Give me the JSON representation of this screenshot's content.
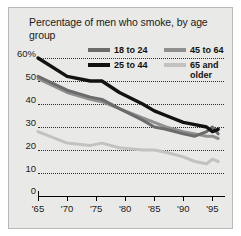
{
  "figure": {
    "title": "Percentage of men who smoke, by age group",
    "background": "#e9e9e7",
    "border": "#b9b9b7"
  },
  "legend": {
    "position": "top-right",
    "items": [
      {
        "label": "18 to 24",
        "color": "#6b6b6b"
      },
      {
        "label": "45 to 64",
        "color": "#8f8f8f"
      },
      {
        "label": "25 to 44",
        "color": "#121212"
      },
      {
        "label": "65 and\nolder",
        "color": "#c2c2c2"
      }
    ]
  },
  "axes": {
    "ylabels": [
      "60%",
      "50",
      "40",
      "30",
      "20",
      "10",
      "0"
    ],
    "xlabels": [
      "'65",
      "'70",
      "'75",
      "'80",
      "'85",
      "'90",
      "'95"
    ]
  },
  "chart_data": {
    "type": "line",
    "title": "Percentage of men who smoke, by age group",
    "xlabel": "",
    "ylabel": "",
    "xlim": [
      1965,
      1997
    ],
    "ylim": [
      0,
      60
    ],
    "yticks": [
      0,
      10,
      20,
      30,
      40,
      50,
      60
    ],
    "ytick_labels": [
      "0",
      "10",
      "20",
      "30",
      "40",
      "50",
      "60%"
    ],
    "xticks": [
      1965,
      1970,
      1975,
      1980,
      1985,
      1990,
      1995
    ],
    "xtick_labels": [
      "'65",
      "'70",
      "'75",
      "'80",
      "'85",
      "'90",
      "'95"
    ],
    "grid": "horizontal-dotted",
    "legend_position": "upper-right",
    "x": [
      1965,
      1970,
      1974,
      1976,
      1979,
      1983,
      1985,
      1987,
      1990,
      1992,
      1994,
      1995,
      1996
    ],
    "series": [
      {
        "name": "25 to 44",
        "color": "#121212",
        "values": [
          60,
          52,
          50,
          50,
          45,
          40,
          37,
          35,
          32,
          31,
          30,
          28,
          29
        ]
      },
      {
        "name": "18 to 24",
        "color": "#6b6b6b",
        "values": [
          52,
          46,
          43,
          42,
          38,
          33,
          30,
          29,
          27,
          26,
          28,
          30,
          27
        ]
      },
      {
        "name": "45 to 64",
        "color": "#8f8f8f",
        "values": [
          51,
          45,
          42,
          41,
          38,
          34,
          32,
          30,
          28,
          27,
          26,
          26,
          25
        ]
      },
      {
        "name": "65 and older",
        "color": "#c2c2c2",
        "values": [
          28,
          23,
          22,
          23,
          21,
          20,
          20,
          19,
          17,
          15,
          14,
          16,
          15
        ]
      }
    ]
  }
}
